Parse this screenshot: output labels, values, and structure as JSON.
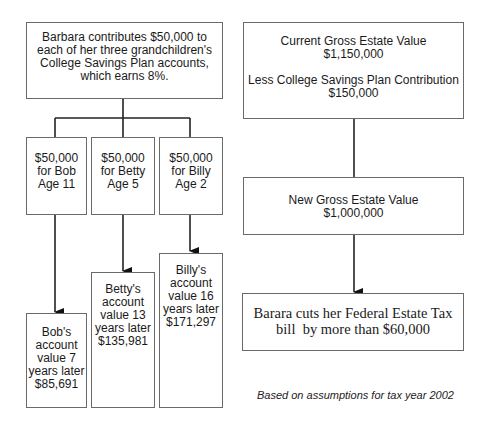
{
  "left_flow": {
    "root": {
      "lines": [
        "Barbara contributes $50,000 to",
        "each of her three grandchildren's",
        "College Savings Plan accounts,",
        "which earns 8%."
      ]
    },
    "children": [
      {
        "name": "Bob",
        "gift": [
          "$50,000",
          "for Bob",
          "Age 11"
        ],
        "result": [
          "Bob's",
          "account",
          "value 7",
          "years later",
          "$85,691"
        ]
      },
      {
        "name": "Betty",
        "gift": [
          "$50,000",
          "for Betty",
          "Age 5"
        ],
        "result": [
          "Betty's",
          "account",
          "value 13",
          "years later",
          "$135,981"
        ]
      },
      {
        "name": "Billy",
        "gift": [
          "$50,000",
          "for Billy",
          "Age 2"
        ],
        "result": [
          "Billy's",
          "account",
          "value 16",
          "years later",
          "$171,297"
        ]
      }
    ]
  },
  "right_flow": {
    "current_estate": {
      "label": "Current Gross Estate Value",
      "value": "$1,150,000",
      "less_label": "Less College Savings Plan Contribution",
      "less_value": "$150,000"
    },
    "new_estate": {
      "label": "New Gross Estate Value",
      "value": "$1,000,000"
    },
    "outcome": {
      "line1": "Barara cuts her Federal Estate Tax",
      "line2": "bill  by more than $60,000"
    }
  },
  "footnote": "Based on assumptions for tax year 2002",
  "colors": {
    "border": "#6a6a6a",
    "line": "#1a1a1a",
    "text": "#1a1a1a"
  }
}
